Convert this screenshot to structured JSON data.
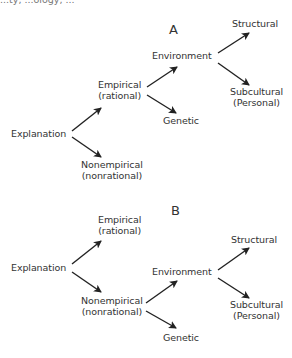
{
  "top_fragment": "...ty, ...ology, ...",
  "diagrams": [
    {
      "label": "A",
      "nodes": {
        "explanation": "Explanation",
        "empirical": [
          "Empirical",
          "(rational)"
        ],
        "nonempirical": [
          "Nonempirical",
          "(nonrational)"
        ],
        "environment": "Environment",
        "genetic": "Genetic",
        "structural": "Structural",
        "subcultural": [
          "Subcultural",
          "(Personal)"
        ]
      },
      "edges": [
        [
          "Explanation",
          "Empirical (rational)"
        ],
        [
          "Explanation",
          "Nonempirical (nonrational)"
        ],
        [
          "Empirical (rational)",
          "Environment"
        ],
        [
          "Empirical (rational)",
          "Genetic"
        ],
        [
          "Environment",
          "Structural"
        ],
        [
          "Environment",
          "Subcultural (Personal)"
        ]
      ]
    },
    {
      "label": "B",
      "nodes": {
        "explanation": "Explanation",
        "empirical": [
          "Empirical",
          "(rational)"
        ],
        "nonempirical": [
          "Nonempirical",
          "(nonrational)"
        ],
        "environment": "Environment",
        "genetic": "Genetic",
        "structural": "Structural",
        "subcultural": [
          "Subcultural",
          "(Personal)"
        ]
      },
      "edges": [
        [
          "Explanation",
          "Empirical (rational)"
        ],
        [
          "Explanation",
          "Nonempirical (nonrational)"
        ],
        [
          "Nonempirical (nonrational)",
          "Environment"
        ],
        [
          "Nonempirical (nonrational)",
          "Genetic"
        ],
        [
          "Environment",
          "Structural"
        ],
        [
          "Environment",
          "Subcultural (Personal)"
        ]
      ]
    }
  ]
}
